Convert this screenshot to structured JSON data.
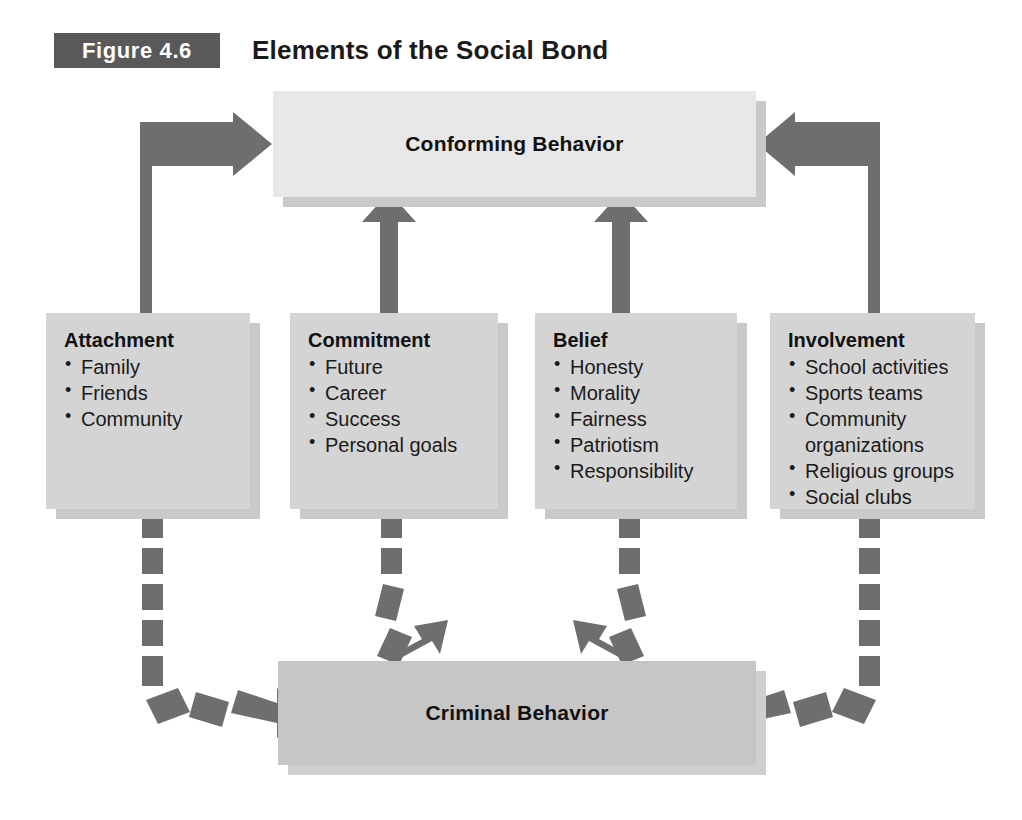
{
  "figure": {
    "label": "Figure 4.6",
    "title": "Elements of the Social Bond",
    "label_bg_color": "#595959",
    "label_text_color": "#ffffff",
    "arrow_color": "#6e6e6e",
    "box_fill_color": "#d4d4d4",
    "banner_top_fill_color": "#e8e8e8",
    "banner_bottom_fill_color": "#c6c6c6",
    "shadow_color": "#c9c9c9"
  },
  "nodes": {
    "conforming": {
      "label": "Conforming Behavior"
    },
    "criminal": {
      "label": "Criminal Behavior"
    },
    "attachment": {
      "title": "Attachment",
      "items": [
        "Family",
        "Friends",
        "Community"
      ]
    },
    "commitment": {
      "title": "Commitment",
      "items": [
        "Future",
        "Career",
        "Success",
        "Personal goals"
      ]
    },
    "belief": {
      "title": "Belief",
      "items": [
        "Honesty",
        "Morality",
        "Fairness",
        "Patriotism",
        "Responsibility"
      ]
    },
    "involvement": {
      "title": "Involvement",
      "items": [
        "School activities",
        "Sports teams",
        "Community\norganizations",
        "Religious groups",
        "Social clubs"
      ]
    }
  },
  "edges": [
    {
      "id": "attachment-to-conforming",
      "from": "attachment",
      "to": "conforming",
      "style": "solid",
      "direction": "up-then-right"
    },
    {
      "id": "commitment-to-conforming",
      "from": "commitment",
      "to": "conforming",
      "style": "solid",
      "direction": "up"
    },
    {
      "id": "belief-to-conforming",
      "from": "belief",
      "to": "conforming",
      "style": "solid",
      "direction": "up"
    },
    {
      "id": "involvement-to-conforming",
      "from": "involvement",
      "to": "conforming",
      "style": "solid",
      "direction": "up-then-left"
    },
    {
      "id": "attachment-to-criminal",
      "from": "attachment",
      "to": "criminal",
      "style": "dashed",
      "direction": "down-then-right"
    },
    {
      "id": "commitment-to-criminal",
      "from": "commitment",
      "to": "criminal",
      "style": "dashed",
      "direction": "down"
    },
    {
      "id": "belief-to-criminal",
      "from": "belief",
      "to": "criminal",
      "style": "dashed",
      "direction": "down"
    },
    {
      "id": "involvement-to-criminal",
      "from": "involvement",
      "to": "criminal",
      "style": "dashed",
      "direction": "down-then-left"
    }
  ]
}
